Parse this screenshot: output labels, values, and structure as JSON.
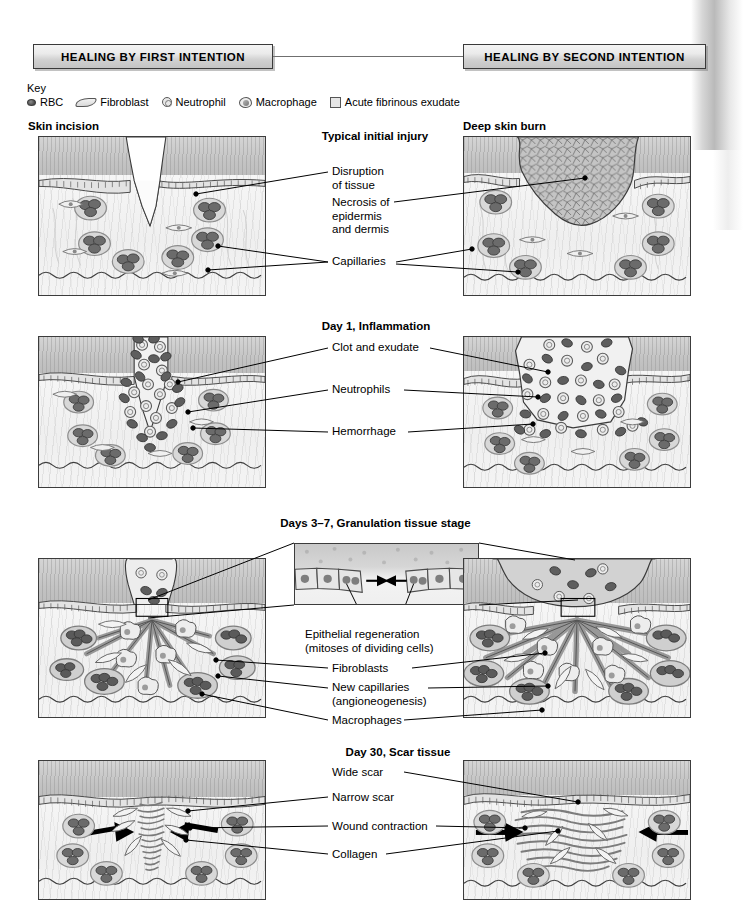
{
  "figure": {
    "left_title": "HEALING BY FIRST INTENTION",
    "right_title": "HEALING BY SECOND INTENTION"
  },
  "key": {
    "label": "Key",
    "items": [
      {
        "icon": "rbc-icon",
        "label": "RBC"
      },
      {
        "icon": "fibroblast-icon",
        "label": "Fibroblast"
      },
      {
        "icon": "neutrophil-icon",
        "label": "Neutrophil"
      },
      {
        "icon": "macrophage-icon",
        "label": "Macrophage"
      },
      {
        "icon": "exudate-icon",
        "label": "Acute fibrinous exudate"
      }
    ]
  },
  "rows": [
    {
      "stage": "Typical initial injury",
      "left_caption": "Skin incision",
      "right_caption": "Deep skin burn",
      "labels": [
        "Disruption\nof tissue",
        "Necrosis of\nepidermis\nand dermis",
        "Capillaries"
      ]
    },
    {
      "stage": "Day 1, Inflammation",
      "left_caption": "",
      "right_caption": "",
      "labels": [
        "Clot and exudate",
        "Neutrophils",
        "Hemorrhage"
      ]
    },
    {
      "stage": "Days 3–7, Granulation tissue stage",
      "left_caption": "",
      "right_caption": "",
      "labels": [
        "Epithelial regeneration\n(mitoses of dividing cells)",
        "Fibroblasts",
        "New capillaries\n(angioneogenesis)",
        "Macrophages"
      ]
    },
    {
      "stage": "Day 30, Scar tissue",
      "left_caption": "",
      "right_caption": "",
      "labels": [
        "Wide scar",
        "Narrow scar",
        "Wound contraction",
        "Collagen"
      ]
    }
  ],
  "colors": {
    "ink": "#000000",
    "panel_border": "#3c3c3c",
    "keratin": "#c6c6c6",
    "dermis": "#f2f2f2",
    "rbc": "#5a5a5a",
    "capillary_wall": "#9a9a9a",
    "clot": "#ededed",
    "necrosis": "#bdbdbd",
    "collagen": "#8c8c8c"
  }
}
